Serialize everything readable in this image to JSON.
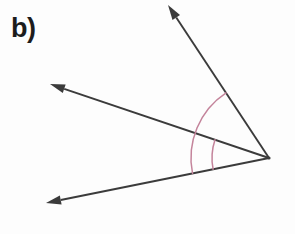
{
  "figure": {
    "panel_label": "b)",
    "background_color": "#fdfdfd",
    "line_color": "#3b3b3b",
    "arc_color": "#c4849b",
    "width": 295,
    "height": 234
  },
  "chart_data": {
    "type": "diagram",
    "title": "b)",
    "xlabel": "",
    "ylabel": "",
    "grid": false,
    "legend": null,
    "vertex": {
      "name": "vertex",
      "x": 269,
      "y": 158
    },
    "rays": [
      {
        "name": "upper-ray",
        "from_x": 269,
        "from_y": 158,
        "to_x": 168,
        "to_y": 5,
        "arrowhead": true,
        "direction_degrees": 56.6
      },
      {
        "name": "middle-ray",
        "from_x": 269,
        "from_y": 158,
        "to_x": 50,
        "to_y": 84,
        "arrowhead": true,
        "direction_degrees": 18.7
      },
      {
        "name": "lower-ray",
        "from_x": 269,
        "from_y": 158,
        "to_x": 46,
        "to_y": 203,
        "arrowhead": true,
        "direction_degrees": -11.4
      }
    ],
    "arcs": [
      {
        "name": "outer-angle-arc",
        "center_x": 269,
        "center_y": 158,
        "radius": 78,
        "start_ray": "upper-ray",
        "end_ray": "lower-ray",
        "start_degrees": 56.6,
        "end_degrees": -11.4,
        "sweep_degrees": 68.0
      },
      {
        "name": "inner-angle-arc",
        "center_x": 269,
        "center_y": 158,
        "radius": 57,
        "start_ray": "middle-ray",
        "end_ray": "lower-ray",
        "start_degrees": 18.7,
        "end_degrees": -11.4,
        "sweep_degrees": 30.1
      }
    ]
  }
}
